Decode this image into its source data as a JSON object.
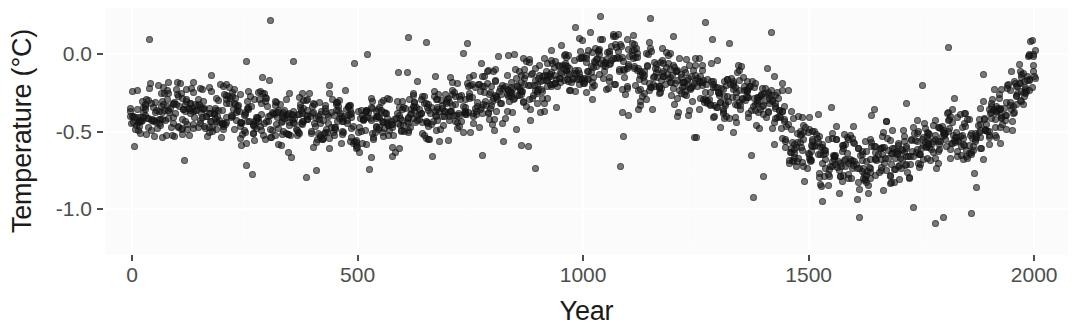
{
  "chart_data": {
    "type": "scatter",
    "title": "",
    "subtitle": "",
    "xlabel": "Year",
    "ylabel": "Temperature (°C)",
    "xlim": [
      -60,
      2075
    ],
    "ylim": [
      -1.3,
      0.3
    ],
    "xticks": [
      0,
      500,
      1000,
      1500,
      2000
    ],
    "xticklabels": [
      "0",
      "500",
      "1000",
      "1500",
      "2000"
    ],
    "yticks": [
      0.0,
      -0.5,
      -1.0
    ],
    "yticklabels": [
      "0.0",
      "-0.5",
      "-1.0"
    ],
    "grid": true,
    "grid_color": "#ffffff",
    "panel_background": "#fbfbfb",
    "legend": null,
    "point_color": "#1a1a1a",
    "point_alpha": 0.58,
    "point_size_px": 7,
    "annotations": [],
    "series": [
      {
        "name": "Temperature anomaly ensemble",
        "spread_sd": 0.085,
        "members_per_year": 9,
        "year_step": 10,
        "trend_x": [
          0,
          40,
          80,
          120,
          160,
          200,
          240,
          280,
          320,
          360,
          400,
          440,
          480,
          520,
          560,
          600,
          640,
          680,
          720,
          760,
          800,
          840,
          880,
          920,
          960,
          1000,
          1040,
          1080,
          1120,
          1160,
          1200,
          1240,
          1280,
          1320,
          1360,
          1400,
          1430,
          1450,
          1470,
          1500,
          1540,
          1580,
          1620,
          1660,
          1700,
          1740,
          1780,
          1820,
          1850,
          1880,
          1910,
          1940,
          1960,
          1980,
          2000
        ],
        "trend_y": [
          -0.4,
          -0.37,
          -0.36,
          -0.38,
          -0.37,
          -0.36,
          -0.38,
          -0.4,
          -0.42,
          -0.41,
          -0.4,
          -0.43,
          -0.45,
          -0.46,
          -0.44,
          -0.42,
          -0.4,
          -0.37,
          -0.33,
          -0.3,
          -0.27,
          -0.24,
          -0.2,
          -0.16,
          -0.12,
          -0.08,
          -0.06,
          -0.05,
          -0.08,
          -0.13,
          -0.18,
          -0.22,
          -0.24,
          -0.25,
          -0.27,
          -0.3,
          -0.33,
          -0.42,
          -0.55,
          -0.62,
          -0.66,
          -0.7,
          -0.7,
          -0.67,
          -0.64,
          -0.61,
          -0.57,
          -0.54,
          -0.52,
          -0.48,
          -0.42,
          -0.33,
          -0.27,
          -0.2,
          -0.12
        ],
        "outlier_rate": 0.11,
        "outlier_spread": 0.26
      }
    ]
  }
}
